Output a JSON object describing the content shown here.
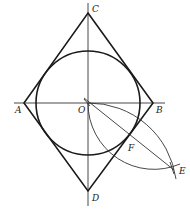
{
  "diagram": {
    "type": "geometry-construction",
    "points": {
      "A": {
        "label": "A",
        "x": 24,
        "y": 103
      },
      "B": {
        "label": "B",
        "x": 153,
        "y": 103
      },
      "C": {
        "label": "C",
        "x": 88,
        "y": 13
      },
      "D": {
        "label": "D",
        "x": 88,
        "y": 191
      },
      "O": {
        "label": "O",
        "x": 88,
        "y": 103
      },
      "E": {
        "label": "E",
        "x": 172,
        "y": 168
      },
      "F": {
        "label": "F",
        "x": 130,
        "y": 145
      }
    },
    "circle": {
      "center": "O",
      "radius": 52
    },
    "labels": {
      "A": "A",
      "B": "B",
      "C": "C",
      "D": "D",
      "O": "O",
      "E": "E",
      "F": "F"
    },
    "colors": {
      "stroke": "#1a1a1a",
      "background": "#ffffff"
    }
  }
}
